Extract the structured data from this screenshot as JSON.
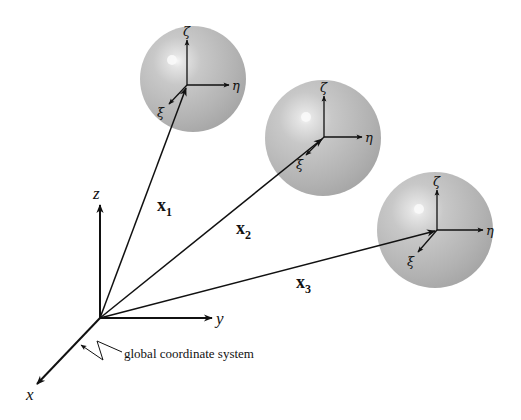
{
  "diagram": {
    "global_axes": {
      "origin": [
        100,
        318
      ],
      "x_label": "x",
      "y_label": "y",
      "z_label": "z",
      "caption": "global coordinate system"
    },
    "spheres": [
      {
        "id": 1,
        "center": [
          193,
          79
        ],
        "radius": 53,
        "local_origin": [
          187,
          85
        ],
        "position_vector_label": "x",
        "position_vector_subscript": "1",
        "zeta_label": "ζ",
        "eta_label": "η",
        "xi_label": "ξ"
      },
      {
        "id": 2,
        "center": [
          323,
          138
        ],
        "radius": 58,
        "local_origin": [
          324,
          137
        ],
        "position_vector_label": "x",
        "position_vector_subscript": "2",
        "zeta_label": "ζ",
        "eta_label": "η",
        "xi_label": "ξ"
      },
      {
        "id": 3,
        "center": [
          435,
          230
        ],
        "radius": 58,
        "local_origin": [
          437,
          230
        ],
        "position_vector_label": "x",
        "position_vector_subscript": "3",
        "zeta_label": "ζ",
        "eta_label": "η",
        "xi_label": "ξ"
      }
    ],
    "colors": {
      "sphere_fill": "#b8b8b8",
      "sphere_highlight": "#f4f4f4",
      "line": "#111111",
      "background": "#ffffff"
    }
  }
}
